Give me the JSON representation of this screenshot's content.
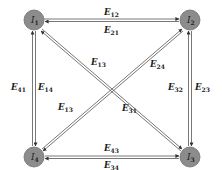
{
  "nodes": [
    {
      "id": "I1",
      "label": "I",
      "sub": "1",
      "x": 34,
      "y": 20
    },
    {
      "id": "I2",
      "label": "I",
      "sub": "2",
      "x": 190,
      "y": 20
    },
    {
      "id": "I3",
      "label": "I",
      "sub": "3",
      "x": 190,
      "y": 157
    },
    {
      "id": "I4",
      "label": "I",
      "sub": "4",
      "x": 34,
      "y": 157
    }
  ],
  "edges": {
    "e12": {
      "label": "E",
      "sub": "12"
    },
    "e21": {
      "label": "E",
      "sub": "21"
    },
    "e43": {
      "label": "E",
      "sub": "43"
    },
    "e34": {
      "label": "E",
      "sub": "34"
    },
    "e41": {
      "label": "E",
      "sub": "41"
    },
    "e14": {
      "label": "E",
      "sub": "14"
    },
    "e32": {
      "label": "E",
      "sub": "32"
    },
    "e23": {
      "label": "E",
      "sub": "23"
    },
    "e13_top": {
      "label": "E",
      "sub": "13"
    },
    "e31": {
      "label": "E",
      "sub": "31"
    },
    "e24": {
      "label": "E",
      "sub": "24"
    },
    "e13_bottom": {
      "label": "E",
      "sub": "13"
    }
  },
  "colors": {
    "node_fill": "#8c8c8c",
    "edge": "#555555"
  }
}
